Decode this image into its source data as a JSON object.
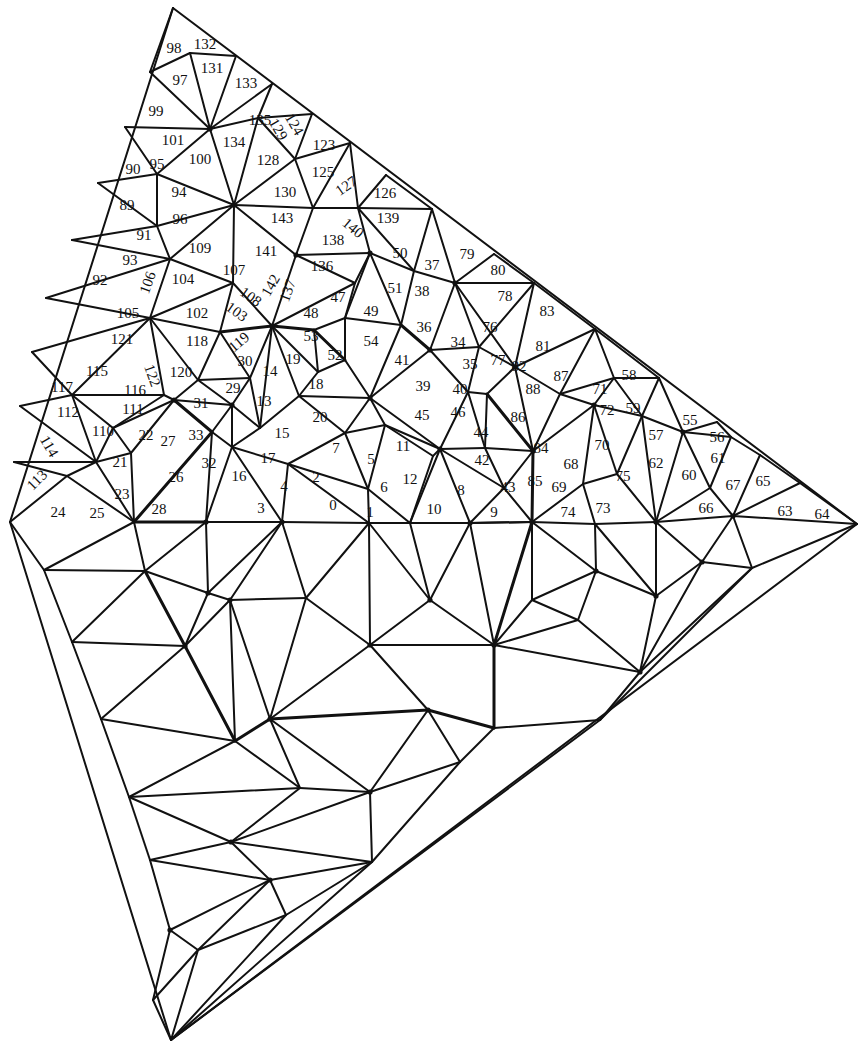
{
  "diagram": {
    "type": "triangulated-mesh",
    "outline": [
      [
        173,
        8
      ],
      [
        857,
        524
      ],
      [
        171,
        1040
      ],
      [
        10,
        522
      ]
    ],
    "labels": [
      {
        "t": "98",
        "x": 174,
        "y": 50
      },
      {
        "t": "132",
        "x": 205,
        "y": 46
      },
      {
        "t": "97",
        "x": 180,
        "y": 82
      },
      {
        "t": "131",
        "x": 212,
        "y": 70
      },
      {
        "t": "133",
        "x": 246,
        "y": 85
      },
      {
        "t": "99",
        "x": 156,
        "y": 113
      },
      {
        "t": "135",
        "x": 260,
        "y": 122
      },
      {
        "t": "124",
        "x": 293,
        "y": 125,
        "r": 60
      },
      {
        "t": "129",
        "x": 277,
        "y": 130,
        "r": 60
      },
      {
        "t": "101",
        "x": 173,
        "y": 142
      },
      {
        "t": "134",
        "x": 234,
        "y": 144
      },
      {
        "t": "123",
        "x": 324,
        "y": 147
      },
      {
        "t": "90",
        "x": 133,
        "y": 171
      },
      {
        "t": "95",
        "x": 157,
        "y": 166
      },
      {
        "t": "100",
        "x": 200,
        "y": 161
      },
      {
        "t": "128",
        "x": 268,
        "y": 162
      },
      {
        "t": "125",
        "x": 323,
        "y": 174
      },
      {
        "t": "127",
        "x": 347,
        "y": 187,
        "r": -35
      },
      {
        "t": "126",
        "x": 385,
        "y": 195
      },
      {
        "t": "94",
        "x": 179,
        "y": 194
      },
      {
        "t": "130",
        "x": 285,
        "y": 194
      },
      {
        "t": "89",
        "x": 127,
        "y": 207
      },
      {
        "t": "96",
        "x": 180,
        "y": 221
      },
      {
        "t": "143",
        "x": 282,
        "y": 220
      },
      {
        "t": "140",
        "x": 352,
        "y": 229,
        "r": 40
      },
      {
        "t": "139",
        "x": 388,
        "y": 220
      },
      {
        "t": "91",
        "x": 144,
        "y": 237
      },
      {
        "t": "109",
        "x": 200,
        "y": 250
      },
      {
        "t": "141",
        "x": 266,
        "y": 253
      },
      {
        "t": "138",
        "x": 333,
        "y": 242
      },
      {
        "t": "50",
        "x": 400,
        "y": 255
      },
      {
        "t": "37",
        "x": 432,
        "y": 267
      },
      {
        "t": "79",
        "x": 467,
        "y": 256
      },
      {
        "t": "93",
        "x": 130,
        "y": 262
      },
      {
        "t": "106",
        "x": 149,
        "y": 283,
        "r": -70
      },
      {
        "t": "104",
        "x": 183,
        "y": 281
      },
      {
        "t": "107",
        "x": 234,
        "y": 272
      },
      {
        "t": "142",
        "x": 272,
        "y": 286,
        "r": -60
      },
      {
        "t": "137",
        "x": 289,
        "y": 291,
        "r": -70
      },
      {
        "t": "136",
        "x": 322,
        "y": 268
      },
      {
        "t": "51",
        "x": 395,
        "y": 290
      },
      {
        "t": "38",
        "x": 422,
        "y": 293
      },
      {
        "t": "80",
        "x": 498,
        "y": 272
      },
      {
        "t": "78",
        "x": 505,
        "y": 298
      },
      {
        "t": "92",
        "x": 100,
        "y": 282
      },
      {
        "t": "108",
        "x": 250,
        "y": 298,
        "r": 35
      },
      {
        "t": "103",
        "x": 236,
        "y": 313,
        "r": 35
      },
      {
        "t": "47",
        "x": 338,
        "y": 299
      },
      {
        "t": "49",
        "x": 371,
        "y": 313
      },
      {
        "t": "83",
        "x": 547,
        "y": 313
      },
      {
        "t": "105",
        "x": 128,
        "y": 315
      },
      {
        "t": "102",
        "x": 197,
        "y": 315
      },
      {
        "t": "48",
        "x": 311,
        "y": 315
      },
      {
        "t": "36",
        "x": 424,
        "y": 329
      },
      {
        "t": "76",
        "x": 490,
        "y": 329
      },
      {
        "t": "121",
        "x": 122,
        "y": 341
      },
      {
        "t": "118",
        "x": 197,
        "y": 343
      },
      {
        "t": "119",
        "x": 240,
        "y": 343,
        "r": -40
      },
      {
        "t": "53",
        "x": 311,
        "y": 338
      },
      {
        "t": "52",
        "x": 335,
        "y": 357
      },
      {
        "t": "54",
        "x": 371,
        "y": 343
      },
      {
        "t": "34",
        "x": 458,
        "y": 344
      },
      {
        "t": "81",
        "x": 543,
        "y": 348
      },
      {
        "t": "30",
        "x": 245,
        "y": 363
      },
      {
        "t": "14",
        "x": 270,
        "y": 373
      },
      {
        "t": "19",
        "x": 293,
        "y": 361
      },
      {
        "t": "115",
        "x": 97,
        "y": 373
      },
      {
        "t": "122",
        "x": 151,
        "y": 376,
        "r": 70
      },
      {
        "t": "120",
        "x": 181,
        "y": 374
      },
      {
        "t": "41",
        "x": 402,
        "y": 362
      },
      {
        "t": "35",
        "x": 470,
        "y": 366
      },
      {
        "t": "77",
        "x": 498,
        "y": 362
      },
      {
        "t": "82",
        "x": 519,
        "y": 368
      },
      {
        "t": "87",
        "x": 561,
        "y": 378
      },
      {
        "t": "58",
        "x": 629,
        "y": 377
      },
      {
        "t": "117",
        "x": 62,
        "y": 389
      },
      {
        "t": "116",
        "x": 135,
        "y": 392
      },
      {
        "t": "29",
        "x": 233,
        "y": 390
      },
      {
        "t": "18",
        "x": 316,
        "y": 386
      },
      {
        "t": "39",
        "x": 423,
        "y": 388
      },
      {
        "t": "40",
        "x": 460,
        "y": 391
      },
      {
        "t": "88",
        "x": 533,
        "y": 391
      },
      {
        "t": "71",
        "x": 600,
        "y": 391
      },
      {
        "t": "13",
        "x": 264,
        "y": 403
      },
      {
        "t": "31",
        "x": 201,
        "y": 405
      },
      {
        "t": "111",
        "x": 133,
        "y": 411
      },
      {
        "t": "112",
        "x": 68,
        "y": 414
      },
      {
        "t": "59",
        "x": 633,
        "y": 410
      },
      {
        "t": "72",
        "x": 607,
        "y": 412
      },
      {
        "t": "86",
        "x": 518,
        "y": 419
      },
      {
        "t": "20",
        "x": 320,
        "y": 419
      },
      {
        "t": "45",
        "x": 422,
        "y": 417
      },
      {
        "t": "46",
        "x": 458,
        "y": 414
      },
      {
        "t": "55",
        "x": 690,
        "y": 422
      },
      {
        "t": "114",
        "x": 48,
        "y": 447,
        "r": 60
      },
      {
        "t": "110",
        "x": 103,
        "y": 433
      },
      {
        "t": "22",
        "x": 146,
        "y": 437
      },
      {
        "t": "27",
        "x": 168,
        "y": 443
      },
      {
        "t": "33",
        "x": 196,
        "y": 437
      },
      {
        "t": "15",
        "x": 282,
        "y": 435
      },
      {
        "t": "7",
        "x": 336,
        "y": 450
      },
      {
        "t": "11",
        "x": 403,
        "y": 448
      },
      {
        "t": "44",
        "x": 481,
        "y": 434
      },
      {
        "t": "84",
        "x": 541,
        "y": 450
      },
      {
        "t": "70",
        "x": 602,
        "y": 447
      },
      {
        "t": "57",
        "x": 656,
        "y": 437
      },
      {
        "t": "56",
        "x": 717,
        "y": 439
      },
      {
        "t": "17",
        "x": 268,
        "y": 460
      },
      {
        "t": "5",
        "x": 371,
        "y": 461
      },
      {
        "t": "42",
        "x": 482,
        "y": 462
      },
      {
        "t": "68",
        "x": 571,
        "y": 466
      },
      {
        "t": "62",
        "x": 656,
        "y": 465
      },
      {
        "t": "60",
        "x": 689,
        "y": 477
      },
      {
        "t": "61",
        "x": 718,
        "y": 460
      },
      {
        "t": "21",
        "x": 120,
        "y": 464
      },
      {
        "t": "32",
        "x": 209,
        "y": 465
      },
      {
        "t": "2",
        "x": 316,
        "y": 479
      },
      {
        "t": "12",
        "x": 410,
        "y": 481
      },
      {
        "t": "16",
        "x": 239,
        "y": 478
      },
      {
        "t": "4",
        "x": 284,
        "y": 488
      },
      {
        "t": "6",
        "x": 384,
        "y": 489
      },
      {
        "t": "26",
        "x": 176,
        "y": 479
      },
      {
        "t": "113",
        "x": 38,
        "y": 481,
        "r": -45
      },
      {
        "t": "8",
        "x": 461,
        "y": 492
      },
      {
        "t": "43",
        "x": 508,
        "y": 489
      },
      {
        "t": "85",
        "x": 535,
        "y": 483
      },
      {
        "t": "69",
        "x": 559,
        "y": 489
      },
      {
        "t": "75",
        "x": 623,
        "y": 478
      },
      {
        "t": "67",
        "x": 733,
        "y": 487
      },
      {
        "t": "65",
        "x": 763,
        "y": 483
      },
      {
        "t": "23",
        "x": 122,
        "y": 496
      },
      {
        "t": "0",
        "x": 333,
        "y": 507
      },
      {
        "t": "1",
        "x": 370,
        "y": 514
      },
      {
        "t": "10",
        "x": 434,
        "y": 511
      },
      {
        "t": "9",
        "x": 494,
        "y": 514
      },
      {
        "t": "74",
        "x": 568,
        "y": 514
      },
      {
        "t": "73",
        "x": 603,
        "y": 510
      },
      {
        "t": "66",
        "x": 706,
        "y": 510
      },
      {
        "t": "63",
        "x": 785,
        "y": 513
      },
      {
        "t": "64",
        "x": 822,
        "y": 516
      },
      {
        "t": "3",
        "x": 261,
        "y": 510
      },
      {
        "t": "28",
        "x": 159,
        "y": 511
      },
      {
        "t": "24",
        "x": 58,
        "y": 514
      },
      {
        "t": "25",
        "x": 97,
        "y": 515
      }
    ]
  }
}
